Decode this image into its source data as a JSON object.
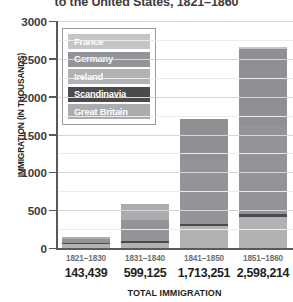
{
  "title": "to the United States, 1821–1860",
  "axes": {
    "ylabel": "IMMIGRATION (IN THOUSANDS)",
    "xlabel": "TOTAL IMMIGRATION",
    "yticks": [
      "3000",
      "2500",
      "2000",
      "1500",
      "1000",
      "500",
      "0"
    ]
  },
  "legend": {
    "items": [
      {
        "label": "France",
        "color": "#c4c5c7"
      },
      {
        "label": "Germany",
        "color": "#929497"
      },
      {
        "label": "Ireland",
        "color": "#b0b2b4"
      },
      {
        "label": "Scandinavia",
        "color": "#4b4b4d"
      },
      {
        "label": "Great Britain",
        "color": "#aaacae"
      }
    ]
  },
  "chart_data": {
    "type": "bar",
    "stacked": true,
    "title": "to the United States, 1821–1860",
    "xlabel": "TOTAL IMMIGRATION",
    "ylabel": "IMMIGRATION (IN THOUSANDS)",
    "ylim": [
      0,
      3000
    ],
    "ytick_step": 500,
    "grid": true,
    "legend_position": "inside-upper-left",
    "units": "thousands",
    "categories": [
      "1821–1830",
      "1831–1840",
      "1841–1850",
      "1851–1860"
    ],
    "totals_label": [
      "143,439",
      "599,125",
      "1,713,251",
      "2,598,214"
    ],
    "totals": [
      143439,
      599125,
      1713251,
      2598214
    ],
    "series": [
      {
        "name": "Ireland",
        "color": "#b0b2b4",
        "values": [
          50,
          100,
          300,
          420
        ]
      },
      {
        "name": "Scandinavia",
        "color": "#4b4b4d",
        "values": [
          3,
          15,
          20,
          50
        ]
      },
      {
        "name": "Germany",
        "color": "#929497",
        "values": [
          45,
          320,
          830,
          1130
        ]
      },
      {
        "name": "Great Britain",
        "color": "#aaacae",
        "values": [
          40,
          125,
          550,
          990
        ]
      },
      {
        "name": "France",
        "color": "#c4c5c7",
        "values": [
          5,
          25,
          15,
          10
        ]
      }
    ]
  },
  "bars": [
    {
      "decade": "1821–1830",
      "total": "143,439",
      "segments": [
        {
          "name": "Ireland",
          "color": "#b0b2b4",
          "px": 4.0
        },
        {
          "name": "Scandinavia",
          "color": "#4b4b4d",
          "px": 1.2
        },
        {
          "name": "Germany",
          "color": "#929497",
          "px": 3.6
        },
        {
          "name": "Great Britain",
          "color": "#aaacae",
          "px": 2.6
        }
      ]
    },
    {
      "decade": "1831–1840",
      "total": "599,125",
      "segments": [
        {
          "name": "Ireland",
          "color": "#b0b2b4",
          "px": 5.5
        },
        {
          "name": "Scandinavia",
          "color": "#4b4b4d",
          "px": 1.8
        },
        {
          "name": "Germany",
          "color": "#929497",
          "px": 20.5
        },
        {
          "name": "Great Britain",
          "color": "#aaacae",
          "px": 16.0
        }
      ]
    },
    {
      "decade": "1841–1850",
      "total": "1,713,251",
      "segments": [
        {
          "name": "Ireland",
          "color": "#b0b2b4",
          "px": 22.0
        },
        {
          "name": "Scandinavia",
          "color": "#4b4b4d",
          "px": 2.0
        },
        {
          "name": "Germany",
          "color": "#929497",
          "px": 63.0
        },
        {
          "name": "Great Britain",
          "color": "#8e9093",
          "px": 42.0
        }
      ]
    },
    {
      "decade": "1851–1860",
      "total": "2,598,214",
      "segments": [
        {
          "name": "Ireland",
          "color": "#b0b2b4",
          "px": 31.0
        },
        {
          "name": "Scandinavia",
          "color": "#4b4b4d",
          "px": 3.5
        },
        {
          "name": "Germany",
          "color": "#929497",
          "px": 88.0
        },
        {
          "name": "Great Britain",
          "color": "#8e9093",
          "px": 77.0
        },
        {
          "name": "France",
          "color": "#c4c5c7",
          "px": 2.0
        }
      ]
    }
  ]
}
